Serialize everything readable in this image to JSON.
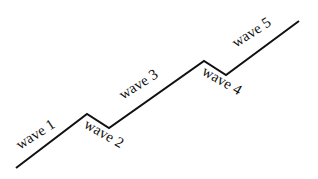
{
  "diagram": {
    "title": "",
    "line_color": "#111111",
    "points": [
      [
        16,
        168
      ],
      [
        87,
        114
      ],
      [
        109,
        128
      ],
      [
        204,
        61
      ],
      [
        226,
        75
      ],
      [
        299,
        21
      ]
    ],
    "labels": [
      {
        "text": "wave 1",
        "x": 20,
        "y": 150,
        "angle": -33
      },
      {
        "text": "wave 2",
        "x": 83,
        "y": 127,
        "angle": 30
      },
      {
        "text": "wave 3",
        "x": 123,
        "y": 100,
        "angle": -33
      },
      {
        "text": "wave 4",
        "x": 201,
        "y": 74,
        "angle": 30
      },
      {
        "text": "wave 5",
        "x": 236,
        "y": 48,
        "angle": -33
      }
    ]
  }
}
